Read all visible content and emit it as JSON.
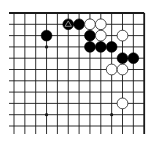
{
  "diagram": {
    "type": "go-board-fragment",
    "colors": {
      "background": "#ffffff",
      "line": "#1a1a1a",
      "black_stone": "#000000",
      "white_stone": "#ffffff",
      "white_stone_outline": "#222222",
      "marker": "#9a9a9a"
    },
    "grid": {
      "columns": 13,
      "rows": 11,
      "origin_x": 14,
      "origin_y": 13,
      "spacing_x": 10.85,
      "spacing_y": 11.3,
      "line_extend_left": 5,
      "line_extend_bottom": 8,
      "edges": [
        "top",
        "right"
      ],
      "stone_radius": 5.4
    },
    "star_points": [
      {
        "col": 3,
        "row": 3
      },
      {
        "col": 3,
        "row": 9
      },
      {
        "col": 9,
        "row": 9
      }
    ],
    "stones": [
      {
        "color": "black",
        "col": 3,
        "row": 2
      },
      {
        "color": "black",
        "col": 5,
        "row": 1,
        "marker": "triangle"
      },
      {
        "color": "black",
        "col": 6,
        "row": 1
      },
      {
        "color": "white",
        "col": 7,
        "row": 1
      },
      {
        "color": "white",
        "col": 8,
        "row": 1
      },
      {
        "color": "black",
        "col": 7,
        "row": 2
      },
      {
        "color": "white",
        "col": 8,
        "row": 2
      },
      {
        "color": "white",
        "col": 10,
        "row": 2
      },
      {
        "color": "black",
        "col": 7,
        "row": 3
      },
      {
        "color": "black",
        "col": 8,
        "row": 3
      },
      {
        "color": "black",
        "col": 9,
        "row": 3
      },
      {
        "color": "black",
        "col": 10,
        "row": 4
      },
      {
        "color": "black",
        "col": 11,
        "row": 4
      },
      {
        "color": "white",
        "col": 9,
        "row": 5
      },
      {
        "color": "white",
        "col": 10,
        "row": 5
      },
      {
        "color": "white",
        "col": 10,
        "row": 8
      }
    ]
  }
}
